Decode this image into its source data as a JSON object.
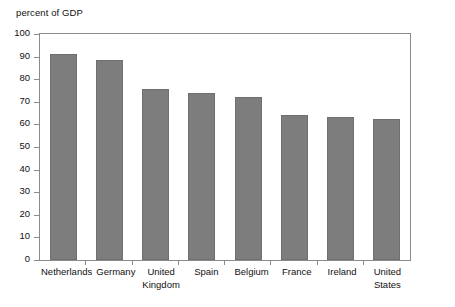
{
  "chart_data": {
    "type": "bar",
    "title": "percent of GDP",
    "xlabel": "",
    "ylabel": "",
    "ylim": [
      0,
      100
    ],
    "yticks": [
      0,
      10,
      20,
      30,
      40,
      50,
      60,
      70,
      80,
      90,
      100
    ],
    "grid": false,
    "legend": false,
    "bar_color": "#7d7d7d",
    "categories": [
      "Netherlands",
      "Germany",
      "United\nKingdom",
      "Spain",
      "Belgium",
      "France",
      "Ireland",
      "United\nStates"
    ],
    "values": [
      91.3,
      88.4,
      75.5,
      73.7,
      72.1,
      64.3,
      63.2,
      62.6
    ]
  },
  "axis": {
    "y_labels": [
      "100",
      "90",
      "80",
      "70",
      "60",
      "50",
      "40",
      "30",
      "20",
      "10",
      "0"
    ],
    "x_labels": [
      {
        "line1": "Netherlands",
        "line2": ""
      },
      {
        "line1": "Germany",
        "line2": ""
      },
      {
        "line1": "United",
        "line2": "Kingdom"
      },
      {
        "line1": "Spain",
        "line2": ""
      },
      {
        "line1": "Belgium",
        "line2": ""
      },
      {
        "line1": "France",
        "line2": ""
      },
      {
        "line1": "Ireland",
        "line2": ""
      },
      {
        "line1": "United",
        "line2": "States"
      }
    ]
  }
}
